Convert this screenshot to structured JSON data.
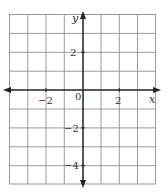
{
  "diagram": {
    "type": "coordinate-grid",
    "x_axis_label": "x",
    "y_axis_label": "y",
    "origin_label": "0",
    "x_range": [
      -4,
      4
    ],
    "y_range": [
      -5,
      4
    ],
    "grid_step": 1,
    "x_tick_labels": [
      {
        "value": -2,
        "text": "−2"
      },
      {
        "value": 2,
        "text": "2"
      }
    ],
    "y_tick_labels": [
      {
        "value": 2,
        "text": "2"
      },
      {
        "value": -2,
        "text": "−2"
      },
      {
        "value": -4,
        "text": "−4"
      }
    ],
    "colors": {
      "grid": "#999999",
      "axis": "#222222",
      "text": "#333333"
    }
  }
}
